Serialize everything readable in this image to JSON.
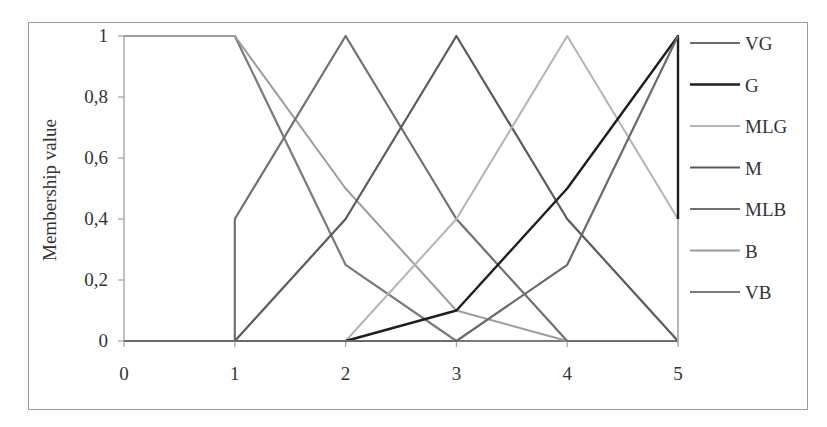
{
  "chart_data": {
    "type": "line",
    "title": "",
    "xlabel": "",
    "ylabel": "Membership value",
    "x": [
      0,
      1,
      2,
      3,
      4,
      5
    ],
    "x_ticks": [
      "0",
      "1",
      "2",
      "3",
      "4",
      "5"
    ],
    "y_ticks": [
      "0",
      "0,2",
      "0,4",
      "0,6",
      "0,8",
      "1"
    ],
    "xlim": [
      0,
      5
    ],
    "ylim": [
      0,
      1
    ],
    "grid": false,
    "legend_position": "right",
    "series": [
      {
        "name": "VG",
        "color": "#6a6a6a",
        "width": 2.2,
        "points": [
          [
            0,
            0
          ],
          [
            1,
            0
          ],
          [
            2,
            0
          ],
          [
            3,
            0
          ],
          [
            4,
            0.25
          ],
          [
            5,
            1
          ]
        ]
      },
      {
        "name": "G",
        "color": "#1e1e1e",
        "width": 2.4,
        "points": [
          [
            2,
            0
          ],
          [
            3,
            0.1
          ],
          [
            4,
            0.5
          ],
          [
            5,
            1
          ],
          [
            5,
            0.4
          ]
        ]
      },
      {
        "name": "MLG",
        "color": "#b4b4b4",
        "width": 2.0,
        "points": [
          [
            0,
            0
          ],
          [
            1,
            0
          ],
          [
            2,
            0
          ],
          [
            3,
            0.4
          ],
          [
            4,
            1
          ],
          [
            5,
            0.4
          ],
          [
            5,
            0
          ]
        ]
      },
      {
        "name": "M",
        "color": "#5a5a5a",
        "width": 2.2,
        "points": [
          [
            0,
            0
          ],
          [
            1,
            0
          ],
          [
            2,
            0.4
          ],
          [
            3,
            1
          ],
          [
            4,
            0.4
          ],
          [
            5,
            0
          ]
        ]
      },
      {
        "name": "MLB",
        "color": "#707070",
        "width": 2.2,
        "points": [
          [
            1,
            0
          ],
          [
            1,
            0.4
          ],
          [
            2,
            1
          ],
          [
            3,
            0.4
          ],
          [
            4,
            0
          ],
          [
            5,
            0
          ]
        ]
      },
      {
        "name": "B",
        "color": "#9c9c9c",
        "width": 2.0,
        "points": [
          [
            0,
            1
          ],
          [
            1,
            1
          ],
          [
            2,
            0.5
          ],
          [
            3,
            0.1
          ],
          [
            4,
            0
          ],
          [
            5,
            0
          ]
        ]
      },
      {
        "name": "VB",
        "color": "#7a7a7a",
        "width": 2.2,
        "points": [
          [
            0,
            1
          ],
          [
            1,
            1
          ],
          [
            2,
            0.25
          ],
          [
            3,
            0
          ],
          [
            4,
            0
          ],
          [
            5,
            0
          ]
        ]
      }
    ]
  }
}
